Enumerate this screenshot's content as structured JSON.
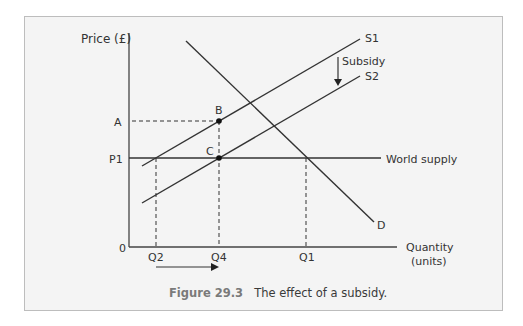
{
  "figure": {
    "number": "Figure 29.3",
    "caption": "The effect of a subsidy."
  },
  "axes": {
    "y_label": "Price (£)",
    "x_label_line1": "Quantity",
    "x_label_line2": "(units)",
    "origin": "0"
  },
  "price_labels": {
    "A": "A",
    "P1": "P1"
  },
  "quantity_labels": {
    "Q2": "Q2",
    "Q4": "Q4",
    "Q1": "Q1"
  },
  "curves": {
    "S1": "S1",
    "S2": "S2",
    "D": "D",
    "world_supply": "World supply"
  },
  "points": {
    "B": "B",
    "C": "C"
  },
  "annotations": {
    "subsidy": "Subsidy"
  },
  "colors": {
    "line": "#333333",
    "background": "#f4f4f4",
    "caption_number": "#7a7a7a"
  }
}
